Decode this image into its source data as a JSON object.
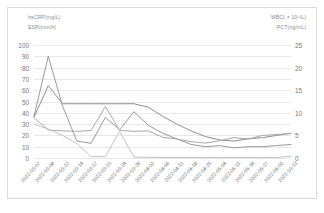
{
  "chart_data": {
    "type": "line",
    "title": "",
    "xlabel": "",
    "ylabel": "",
    "grid": true,
    "legend_position": "top-corners",
    "categories": [
      "2022-03-07",
      "2022-03-08",
      "2022-03-12",
      "2022-03-14",
      "2022-03-17",
      "2022-03-21",
      "2022-03-24",
      "2022-03-28",
      "2022-04-02",
      "2022-04-06",
      "2022-04-11",
      "2022-04-18",
      "2022-04-25",
      "2022-05-04",
      "2022-05-11",
      "2022-05-18",
      "2022-05-27",
      "2022-06-03",
      "2022-10-13"
    ],
    "left_axis": {
      "label": "hsCRP(mg/L)  ESR(mm/h)",
      "ylim": [
        0,
        100
      ],
      "ticks": [
        "0",
        "10",
        "20",
        "30",
        "40",
        "50",
        "60",
        "70",
        "80",
        "90",
        "100"
      ]
    },
    "right_axis": {
      "label": "WBC( × 10⁹/L)  PCT(ng/mL)",
      "ylim": [
        0,
        25
      ],
      "ticks": [
        "0",
        "5",
        "10",
        "15",
        "20",
        "25"
      ]
    },
    "series": [
      {
        "name": "hsCRP(mg/L)",
        "axis": "left",
        "color": "#9a9a9a",
        "values": [
          37,
          90,
          46,
          15,
          13,
          36,
          25,
          41,
          29,
          22,
          17,
          12,
          10,
          11,
          9,
          10,
          10,
          11,
          12
        ]
      },
      {
        "name": "ESR(mm/h)",
        "axis": "left",
        "color": "#8e8e8e",
        "values": [
          36,
          64,
          48,
          48,
          48,
          48,
          48,
          48,
          45,
          37,
          30,
          24,
          19,
          16,
          15,
          17,
          18,
          20,
          22
        ]
      },
      {
        "name": "WBC( × 10⁹/L)",
        "axis": "right",
        "color": "#a8a8a8",
        "values": [
          8.9,
          6.2,
          6.0,
          5.9,
          6.1,
          11.4,
          6.1,
          5.9,
          6.0,
          4.6,
          4.2,
          3.6,
          3.3,
          3.8,
          4.5,
          4.2,
          5.0,
          5.2,
          5.4
        ]
      },
      {
        "name": "PCT(ng/mL)",
        "axis": "right",
        "color": "#c2c2c2",
        "values": [
          7.5,
          6.4,
          5.0,
          3.2,
          0.3,
          0.3,
          5.9,
          0.2,
          0.15,
          0.12,
          0.1,
          0.1,
          0.1,
          0.1,
          0.1,
          0.1,
          0.1,
          0.1,
          0.4
        ]
      }
    ]
  },
  "legend": {
    "top_left_1": "hsCRP(mg/L)",
    "top_left_2": "ESR(mm/h)",
    "top_right_1": "WBC( × 10⁹/L)",
    "top_right_2": "PCT(ng/mL)"
  }
}
